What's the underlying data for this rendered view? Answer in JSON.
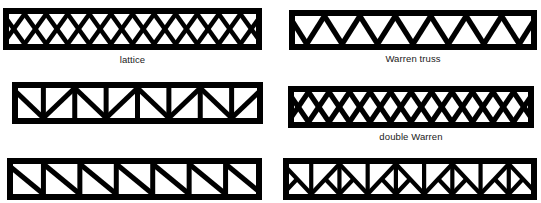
{
  "figure": {
    "background_color": "#ffffff",
    "line_color": "#000000",
    "label_color": "#1a1a1a"
  },
  "trusses": [
    {
      "id": "lattice",
      "label": "lattice",
      "pattern": "lattice",
      "x": 3,
      "y": 8,
      "width": 259,
      "height": 42,
      "chord_thickness": 6,
      "web_thickness": 4.6,
      "panels": 12,
      "has_end_posts": true,
      "label_x": 3,
      "label_y": 54
    },
    {
      "id": "warren-truss",
      "label": "Warren truss",
      "pattern": "warren",
      "x": 289,
      "y": 10,
      "width": 248,
      "height": 40,
      "chord_thickness": 6,
      "web_thickness": 5.2,
      "panels": 14,
      "has_end_posts": true,
      "label_x": 289,
      "label_y": 53
    },
    {
      "id": "pratt-alternating",
      "label": "",
      "pattern": "alternating-vertical-diagonal",
      "x": 12,
      "y": 82,
      "width": 251,
      "height": 42,
      "chord_thickness": 6,
      "web_thickness": 5.0,
      "panels": 8,
      "has_end_posts": true,
      "label_x": 12,
      "label_y": 126
    },
    {
      "id": "double-warren",
      "label": "double Warren",
      "pattern": "double-warren",
      "x": 288,
      "y": 86,
      "width": 246,
      "height": 42,
      "chord_thickness": 6,
      "web_thickness": 5.2,
      "panels": 12,
      "has_end_posts": true,
      "label_x": 288,
      "label_y": 131
    },
    {
      "id": "howe-parallel-diagonals",
      "label": "",
      "pattern": "parallel-diagonals",
      "x": 7,
      "y": 158,
      "width": 255,
      "height": 42,
      "chord_thickness": 6,
      "web_thickness": 5.0,
      "panels": 7,
      "has_end_posts": true,
      "label_x": 7,
      "label_y": 202
    },
    {
      "id": "k-truss",
      "label": "",
      "pattern": "k-truss",
      "x": 283,
      "y": 158,
      "width": 254,
      "height": 42,
      "chord_thickness": 6,
      "web_thickness": 4.2,
      "panels": 9,
      "has_end_posts": true,
      "label_x": 283,
      "label_y": 202
    }
  ]
}
